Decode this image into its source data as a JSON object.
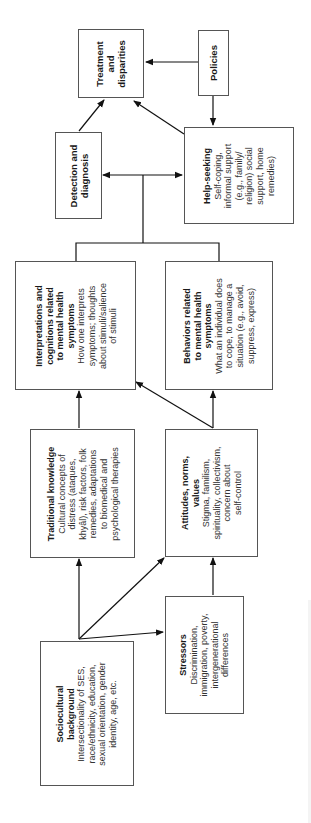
{
  "diagram": {
    "orientation": "rotated-90-ccw",
    "nodes": {
      "treatment": {
        "title": "Treatment and disparities",
        "title_lines": [
          "Treatment",
          "and",
          "disparities"
        ]
      },
      "policies": {
        "title": "Policies"
      },
      "detection": {
        "title": "Detection and diagnosis",
        "title_lines": [
          "Detection and",
          "diagnosis"
        ]
      },
      "help_seeking": {
        "title": "Help-seeking",
        "desc_lines": [
          "Self-coping,",
          "informal support",
          "(e.g., family/",
          "religion) social",
          "support, home",
          "remedies)"
        ]
      },
      "interpretations": {
        "title_lines": [
          "Interpretations and",
          "cognitions related",
          "to mental health",
          "symptoms"
        ],
        "desc_lines": [
          "How one interprets",
          "symptoms; thoughts",
          "about stimuli/salience",
          "of stimuli"
        ]
      },
      "behaviors": {
        "title_lines": [
          "Behaviors related",
          "to mental health",
          "symptoms"
        ],
        "desc_lines": [
          "What an individual does",
          "to cope, to manage a",
          "situation (e.g., avoid,",
          "suppress, express)"
        ]
      },
      "traditional": {
        "title": "Traditional knowledge",
        "desc_lines": [
          "Cultural concepts of",
          "distress (ataques,",
          "khyâl), risk factors, folk",
          "remedies, adaptations",
          "to biomedical and",
          "psychological therapies"
        ]
      },
      "attitudes": {
        "title_lines": [
          "Attitudes, norms,",
          "values"
        ],
        "desc_lines": [
          "Stigma, familism,",
          "spirituality, collectivism,",
          "concern about",
          "self-control"
        ]
      },
      "sociocultural": {
        "title_lines": [
          "Sociocultural",
          "background"
        ],
        "desc_lines": [
          "Intersectionality of SES,",
          "race/ethnicity, education,",
          "sexual orientation, gender",
          "identity, age, etc."
        ]
      },
      "stressors": {
        "title": "Stressors",
        "desc_lines": [
          "Discrimination,",
          "immigration, poverty,",
          "intergenerational",
          "differences"
        ]
      }
    },
    "edges": [
      {
        "from": "Sociocultural background",
        "to": "Traditional knowledge"
      },
      {
        "from": "Sociocultural background",
        "to": "Attitudes, norms, values"
      },
      {
        "from": "Sociocultural background",
        "to": "Stressors"
      },
      {
        "from": "Stressors",
        "to": "Attitudes, norms, values"
      },
      {
        "from": "Traditional knowledge",
        "to": "Interpretations and cognitions related to mental health symptoms"
      },
      {
        "from": "Attitudes, norms, values",
        "to": "Interpretations and cognitions related to mental health symptoms"
      },
      {
        "from": "Attitudes, norms, values",
        "to": "Behaviors related to mental health symptoms"
      },
      {
        "from": "Interpretations + Behaviors",
        "to": "Detection and diagnosis"
      },
      {
        "from": "Interpretations + Behaviors",
        "to": "Help-seeking"
      },
      {
        "from": "Detection and diagnosis",
        "to": "Treatment and disparities"
      },
      {
        "from": "Help-seeking",
        "to": "Treatment and disparities"
      },
      {
        "from": "Policies",
        "to": "Treatment and disparities"
      },
      {
        "from": "Policies",
        "to": "Help-seeking"
      }
    ],
    "colors": {
      "line": "#111111",
      "border": "#555555",
      "background": "#ffffff"
    }
  }
}
